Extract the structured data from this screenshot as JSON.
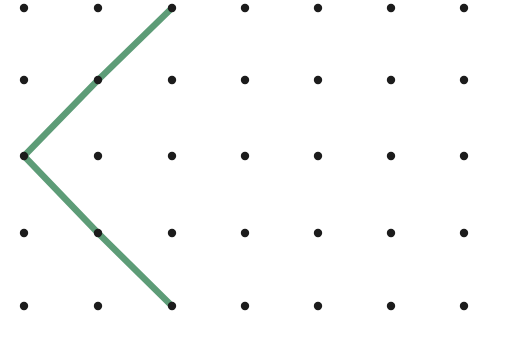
{
  "canvas": {
    "width": 525,
    "height": 338,
    "background_color": "#ffffff",
    "title": "Dot grid with a green angle figure"
  },
  "grid": {
    "columns": 7,
    "rows": 5,
    "x_positions": [
      24,
      98,
      172,
      245,
      318,
      391,
      464
    ],
    "y_positions": [
      8,
      80,
      156,
      233,
      306
    ],
    "dot_color": "#1c1c1c",
    "dot_radius": 4.2,
    "spacing_x": 73.3,
    "spacing_y": 74.5
  },
  "figure": {
    "name": "angle-chevron",
    "shape": "open angle (chevron pointing left)",
    "stroke_color": "#5d9c77",
    "stroke_width": 6.5,
    "line_cap": "round",
    "line_join": "round",
    "vertex": {
      "col": 0,
      "row": 2,
      "x": 24,
      "y": 156
    },
    "rays": [
      {
        "name": "upper-ray",
        "from": {
          "col": 0,
          "row": 2,
          "x": 24,
          "y": 156
        },
        "through": {
          "col": 1,
          "row": 1,
          "x": 98,
          "y": 80
        },
        "to": {
          "col": 2,
          "row": 0,
          "x": 172,
          "y": 8
        }
      },
      {
        "name": "lower-ray",
        "from": {
          "col": 0,
          "row": 2,
          "x": 24,
          "y": 156
        },
        "through": {
          "col": 1,
          "row": 3,
          "x": 98,
          "y": 233
        },
        "to": {
          "col": 2,
          "row": 4,
          "x": 172,
          "y": 306
        }
      }
    ],
    "points": [
      {
        "x": 172,
        "y": 8
      },
      {
        "x": 24,
        "y": 156
      },
      {
        "x": 172,
        "y": 306
      }
    ]
  }
}
